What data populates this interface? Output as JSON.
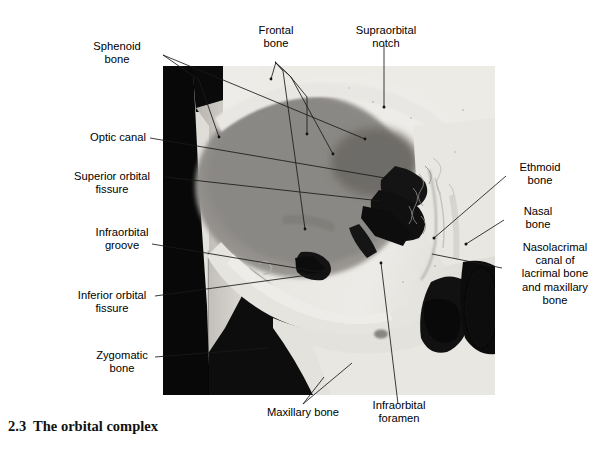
{
  "figure": {
    "caption_number": "2.3",
    "caption_title": "The orbital complex",
    "caption": "2.3  The orbital complex",
    "image_kind": "photograph"
  },
  "labels": [
    {
      "id": "sphenoid-bone",
      "text": "Sphenoid\nbone",
      "align": "center"
    },
    {
      "id": "frontal-bone",
      "text": "Frontal\nbone",
      "align": "center"
    },
    {
      "id": "supraorbital-notch",
      "text": "Supraorbital\nnotch",
      "align": "center"
    },
    {
      "id": "optic-canal",
      "text": "Optic canal",
      "align": "right"
    },
    {
      "id": "superior-orbital-fissure",
      "text": "Superior orbital\nfissure",
      "align": "center"
    },
    {
      "id": "infraorbital-groove",
      "text": "Infraorbital\ngroove",
      "align": "center"
    },
    {
      "id": "inferior-orbital-fissure",
      "text": "Inferior orbital\nfissure",
      "align": "center"
    },
    {
      "id": "zygomatic-bone",
      "text": "Zygomatic\nbone",
      "align": "center"
    },
    {
      "id": "ethmoid-bone",
      "text": "Ethmoid\nbone",
      "align": "center"
    },
    {
      "id": "nasal-bone",
      "text": "Nasal\nbone",
      "align": "center"
    },
    {
      "id": "nasolacrimal-canal",
      "text": "Nasolacrimal\ncanal of\nlacrimal bone\nand maxillary\nbone",
      "align": "center"
    },
    {
      "id": "maxillary-bone",
      "text": "Maxillary bone",
      "align": "center"
    },
    {
      "id": "infraorbital-foramen",
      "text": "Infraorbital\nforamen",
      "align": "center"
    }
  ],
  "colors": {
    "page_background": "#ffffff",
    "text": "#000000",
    "leader_line": "#1a1a1a",
    "photo_background_dark": "#090909",
    "bone_light": "#e3e1dc",
    "bone_mid": "#c9c6c0",
    "orbit_shadow": "#8d8b87"
  }
}
